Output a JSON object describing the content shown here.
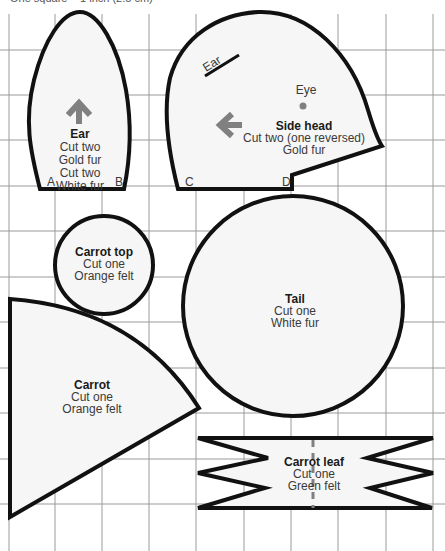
{
  "caption": "One square = 1 inch (2.5 cm)",
  "colors": {
    "outline": "#111111",
    "fill": "#f6f6f6",
    "grid": "#9a9a9a",
    "arrow": "#808080",
    "text": "#3a3a3a"
  },
  "grid": {
    "x": [
      9,
      55,
      102,
      149,
      196,
      244,
      291,
      338,
      386,
      433
    ],
    "y": [
      50,
      95,
      140,
      186,
      231,
      277,
      322,
      368,
      413,
      459,
      504
    ]
  },
  "pieces": {
    "ear": {
      "title": "Ear",
      "lines": [
        "Cut two",
        "Gold fur",
        "Cut two",
        "White fur"
      ],
      "points": {
        "a": "A",
        "b": "B"
      },
      "grain_arrow": "arrow-up"
    },
    "side_head": {
      "title": "Side head",
      "lines": [
        "Cut two (one reversed)",
        "Gold fur"
      ],
      "points": {
        "c": "C",
        "d": "D"
      },
      "marks": {
        "ear": "Ear",
        "eye": "Eye"
      },
      "grain_arrow": "arrow-left"
    },
    "carrot_top": {
      "title": "Carrot top",
      "lines": [
        "Cut one",
        "Orange felt"
      ]
    },
    "tail": {
      "title": "Tail",
      "lines": [
        "Cut one",
        "White fur"
      ]
    },
    "carrot": {
      "title": "Carrot",
      "lines": [
        "Cut one",
        "Orange felt"
      ]
    },
    "carrot_leaf": {
      "title": "Carrot leaf",
      "lines": [
        "Cut one",
        "Green felt"
      ]
    }
  }
}
